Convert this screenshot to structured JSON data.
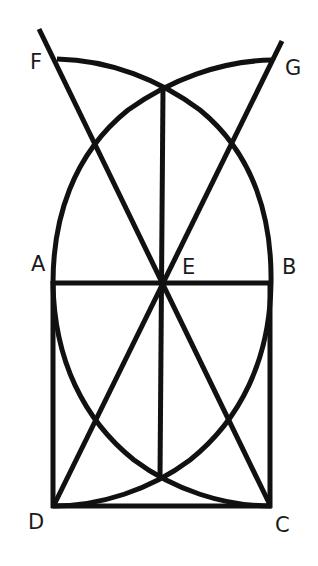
{
  "diagram": {
    "stroke_color": "#111111",
    "background": "#ffffff",
    "points": {
      "A": {
        "label": "A",
        "x": 53,
        "y": 283
      },
      "B": {
        "label": "B",
        "x": 271,
        "y": 283
      },
      "C": {
        "label": "C",
        "x": 271,
        "y": 506
      },
      "D": {
        "label": "D",
        "x": 53,
        "y": 506
      },
      "E": {
        "label": "E",
        "x": 163,
        "y": 283
      },
      "F": {
        "label": "F",
        "x": 57,
        "y": 59
      },
      "G": {
        "label": "G",
        "x": 272,
        "y": 60
      }
    },
    "labels": [
      "F",
      "G",
      "A",
      "E",
      "B",
      "D",
      "C"
    ]
  }
}
